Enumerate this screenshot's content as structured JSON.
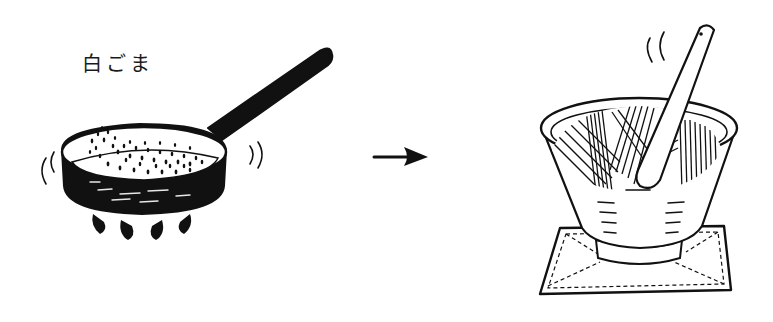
{
  "illustration": {
    "style": "pen-and-ink line drawing",
    "ink_color": "#111111",
    "paper_color": "#ffffff",
    "left_panel": {
      "label": "白ごま",
      "subject": "frying pan roasting white sesame seeds over flame",
      "elements": [
        "frying-pan",
        "sesame-seeds",
        "flames",
        "heat-motion-lines"
      ]
    },
    "arrow": {
      "direction": "right"
    },
    "right_panel": {
      "subject": "suribachi mortar with surikogi pestle grinding sesame, on a stitched cloth mat",
      "elements": [
        "mortar-bowl",
        "pestle",
        "ridged-interior",
        "cloth-mat",
        "steam-lines"
      ]
    }
  }
}
